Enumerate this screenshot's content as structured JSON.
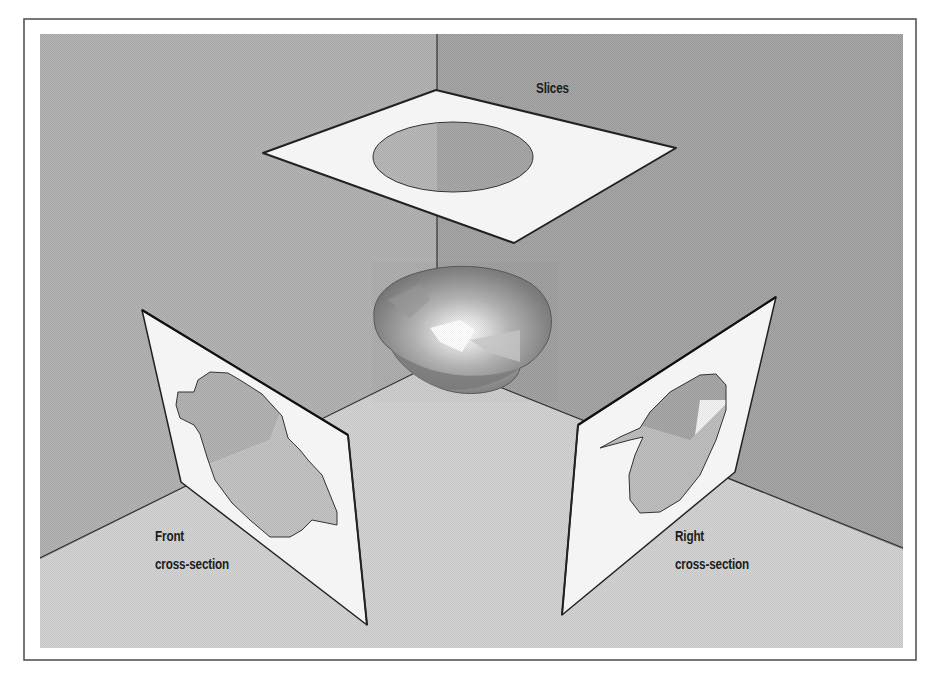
{
  "figure": {
    "labels": {
      "slices": "Slices",
      "front": {
        "line1": "Front",
        "line2": "cross-section"
      },
      "right": {
        "line1": "Right",
        "line2": "cross-section"
      }
    },
    "colors": {
      "page_background": "#ffffff",
      "frame_border": "#555555",
      "left_wall": "#b4b4b4",
      "right_wall": "#a6a6a6",
      "floor": "#d4d4d4",
      "panel_fill": "#f4f4f4",
      "panel_edge": "#222222",
      "cutout_dark": "#a9a9a9",
      "cutout_light": "#bfbfbf",
      "label_text": "#1c1c1c"
    }
  }
}
